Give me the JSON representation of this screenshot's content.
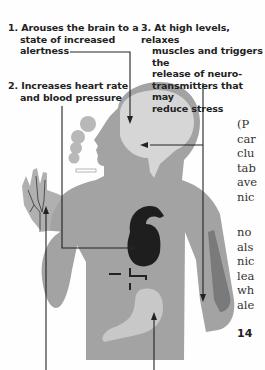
{
  "infographic": {
    "callouts": [
      {
        "number": "1.",
        "lines": [
          "Arouses the brain to a",
          "state of increased",
          "alertness"
        ]
      },
      {
        "number": "2.",
        "lines": [
          "Increases heart rate",
          "and blood pressure"
        ]
      },
      {
        "number": "3.",
        "lines": [
          "At high levels, relaxes",
          "muscles and triggers the",
          "release of neuro-",
          "transmitters that may",
          "reduce stress"
        ]
      }
    ],
    "colors": {
      "body": "#a3a3a3",
      "brain": "#d6d6d6",
      "heart": "#1e1e1e",
      "stomach": "#c8c8c8",
      "arm_muscle": "#7a7a7a",
      "lines": "#222222"
    }
  },
  "body_text": {
    "block1": [
      "(P",
      "car",
      "clu",
      "tab",
      "ave",
      "nic"
    ],
    "block2": [
      "no",
      "als",
      "nic",
      "lea",
      "wh",
      "ale"
    ],
    "page_number": "14"
  }
}
